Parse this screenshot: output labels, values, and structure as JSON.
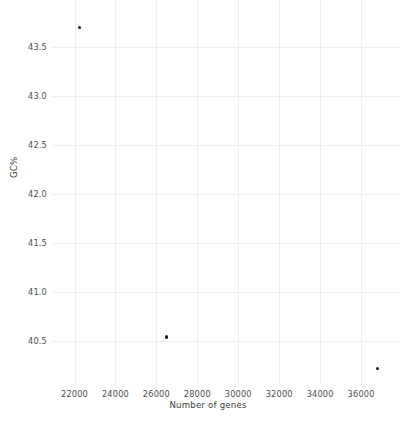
{
  "chart_data": {
    "type": "scatter",
    "title": "",
    "xlabel": "Number of genes",
    "ylabel": "GC%",
    "xlim": [
      20900,
      37900
    ],
    "ylim": [
      40.05,
      43.98
    ],
    "xticks": [
      22000,
      24000,
      26000,
      28000,
      30000,
      32000,
      34000,
      36000
    ],
    "xtick_labels": [
      "22000",
      "24000",
      "26000",
      "28000",
      "30000",
      "32000",
      "34000",
      "36000"
    ],
    "yticks": [
      40.5,
      41.0,
      41.5,
      42.0,
      42.5,
      43.0,
      43.5
    ],
    "ytick_labels": [
      "40.5",
      "41.0",
      "41.5",
      "42.0",
      "42.5",
      "43.0",
      "43.5"
    ],
    "grid": true,
    "legend": false,
    "marker_color": "#1a1a1a",
    "grid_color": "#eeeeee",
    "background_color": "#ffffff",
    "points": [
      {
        "x": 22250,
        "y": 43.7
      },
      {
        "x": 26500,
        "y": 40.54
      },
      {
        "x": 36800,
        "y": 40.22
      }
    ]
  }
}
